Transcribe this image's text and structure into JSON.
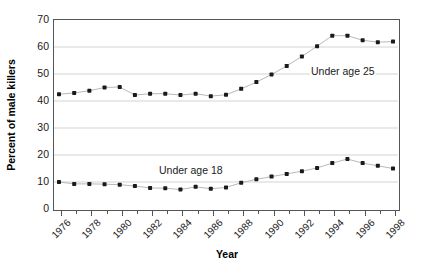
{
  "chart_data": {
    "type": "line",
    "title": "",
    "xlabel": "Year",
    "ylabel": "Percent of male killers",
    "ylim": [
      0,
      70
    ],
    "ytick_step": 10,
    "yticks": [
      70,
      60,
      50,
      40,
      30,
      20,
      10,
      0
    ],
    "xlim": [
      1976,
      1998
    ],
    "grid": "horizontal",
    "legend_position": "inline-annotation",
    "marker": "square-dot",
    "x": [
      1976,
      1977,
      1978,
      1979,
      1980,
      1981,
      1982,
      1983,
      1984,
      1985,
      1986,
      1987,
      1988,
      1989,
      1990,
      1991,
      1992,
      1993,
      1994,
      1995,
      1996,
      1997,
      1998
    ],
    "xtick_labels": [
      "1976",
      "1978",
      "1980",
      "1982",
      "1984",
      "1986",
      "1988",
      "1990",
      "1992",
      "1994",
      "1996",
      "1998"
    ],
    "xtick_years": [
      1976,
      1978,
      1980,
      1982,
      1984,
      1986,
      1988,
      1990,
      1992,
      1994,
      1996,
      1998
    ],
    "series": [
      {
        "name": "Under age 25",
        "annotation": "Under age 25",
        "color": "#1a1a1a",
        "values": [
          42.5,
          43.0,
          43.8,
          45.0,
          45.2,
          42.2,
          42.7,
          42.7,
          42.2,
          42.7,
          41.8,
          42.3,
          44.5,
          47.0,
          49.8,
          53.0,
          56.5,
          60.3,
          64.2,
          64.2,
          62.5,
          61.8,
          62.0
        ]
      },
      {
        "name": "Under age 18",
        "annotation": "Under age 18",
        "color": "#1a1a1a",
        "values": [
          10.0,
          9.3,
          9.3,
          9.2,
          9.0,
          8.5,
          7.8,
          7.7,
          7.2,
          8.2,
          7.5,
          8.0,
          9.7,
          11.0,
          12.0,
          13.0,
          14.0,
          15.2,
          17.0,
          18.5,
          17.0,
          16.0,
          15.0
        ]
      }
    ],
    "last_point_u25": 59.8,
    "last_point_u18": 12.7
  },
  "annotations": {
    "under25": "Under age 25",
    "under18": "Under age 18"
  }
}
